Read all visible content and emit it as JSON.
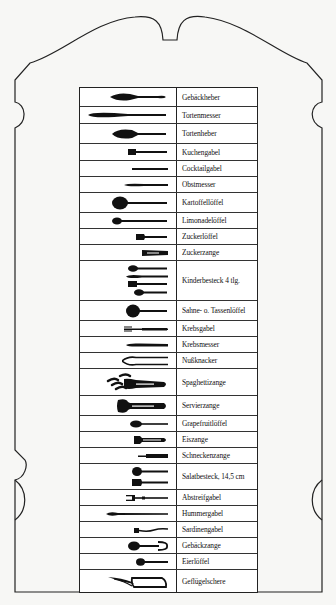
{
  "frame": {
    "stroke": "#222222",
    "background": "#f7f7f5"
  },
  "table": {
    "columns": [
      "icon",
      "name"
    ],
    "rows": [
      {
        "icon": "cake-server-icon",
        "label": "Gebäckheber",
        "height": 19
      },
      {
        "icon": "cake-knife-icon",
        "label": "Tortenmesser",
        "height": 17
      },
      {
        "icon": "tart-server-icon",
        "label": "Tortenheber",
        "height": 20
      },
      {
        "icon": "cake-fork-icon",
        "label": "Kuchengabel",
        "height": 17
      },
      {
        "icon": "cocktail-fork-icon",
        "label": "Cocktailgabel",
        "height": 16
      },
      {
        "icon": "fruit-knife-icon",
        "label": "Obstmesser",
        "height": 16
      },
      {
        "icon": "potato-spoon-icon",
        "label": "Kartoffellöffel",
        "height": 20
      },
      {
        "icon": "lemonade-spoon-icon",
        "label": "Limonadelöffel",
        "height": 16
      },
      {
        "icon": "sugar-spoon-icon",
        "label": "Zuckerlöffel",
        "height": 16
      },
      {
        "icon": "sugar-tongs-icon",
        "label": "Zuckerzange",
        "height": 16
      },
      {
        "icon": "childrens-cutlery-icon",
        "label": "Kinderbesteck 4 tlg.",
        "height": 40
      },
      {
        "icon": "cream-spoon-icon",
        "label": "Sahne- o. Tassenlöffel",
        "height": 20
      },
      {
        "icon": "crab-fork-icon",
        "label": "Krebsgabel",
        "height": 16
      },
      {
        "icon": "crab-knife-icon",
        "label": "Krebsmesser",
        "height": 16
      },
      {
        "icon": "nutcracker-icon",
        "label": "Nußknacker",
        "height": 16
      },
      {
        "icon": "spaghetti-tongs-icon",
        "label": "Spaghettizange",
        "height": 27
      },
      {
        "icon": "serving-tongs-icon",
        "label": "Servierzange",
        "height": 20
      },
      {
        "icon": "grapefruit-spoon-icon",
        "label": "Grapefruitlöffel",
        "height": 16
      },
      {
        "icon": "ice-tongs-icon",
        "label": "Eiszange",
        "height": 16
      },
      {
        "icon": "snail-tongs-icon",
        "label": "Schneckenzange",
        "height": 16
      },
      {
        "icon": "salad-servers-icon",
        "label": "Salatbesteck, 14,5 cm",
        "height": 26
      },
      {
        "icon": "stripping-fork-icon",
        "label": "Abstreifgabel",
        "height": 16
      },
      {
        "icon": "lobster-fork-icon",
        "label": "Hummergabel",
        "height": 16
      },
      {
        "icon": "sardine-fork-icon",
        "label": "Sardinengabel",
        "height": 16
      },
      {
        "icon": "pastry-tongs-icon",
        "label": "Gebäckzange",
        "height": 16
      },
      {
        "icon": "egg-spoon-icon",
        "label": "Eierlöffel",
        "height": 16
      },
      {
        "icon": "poultry-shears-icon",
        "label": "Geflügelschere",
        "height": 22
      }
    ]
  }
}
